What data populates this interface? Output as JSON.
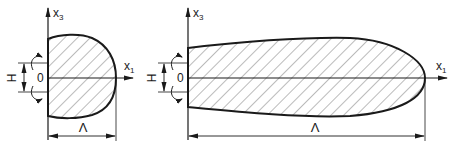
{
  "figures": [
    {
      "id": "short-body",
      "labels": {
        "x1": "x",
        "x1_sub": "1",
        "x3": "x",
        "x3_sub": "3",
        "origin": "0",
        "height": "H",
        "length": "Λ"
      }
    },
    {
      "id": "long-body",
      "labels": {
        "x1": "x",
        "x1_sub": "1",
        "x3": "x",
        "x3_sub": "3",
        "origin": "0",
        "height": "H",
        "length": "Λ"
      }
    }
  ],
  "colors": {
    "stroke": "#1a1a1a",
    "hatch": "#555555",
    "background": "#ffffff"
  }
}
